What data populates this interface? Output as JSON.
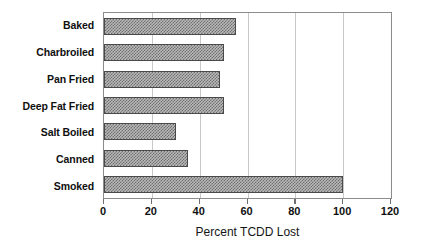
{
  "chart_data": {
    "type": "bar",
    "orientation": "horizontal",
    "title": "",
    "xlabel": "Percent TCDD Lost",
    "ylabel": "",
    "categories": [
      "Baked",
      "Charbroiled",
      "Pan Fried",
      "Deep Fat Fried",
      "Salt Boiled",
      "Canned",
      "Smoked"
    ],
    "values": [
      55,
      50,
      48.5,
      50,
      30,
      35,
      100
    ],
    "xlim": [
      0,
      120
    ],
    "xticks": [
      0,
      20,
      40,
      60,
      80,
      100,
      120
    ],
    "xtick_labels": [
      "0",
      "20",
      "40",
      "60",
      "80",
      "100",
      "120"
    ],
    "grid": "vertical",
    "legend": "none",
    "series": [
      {
        "name": "Percent TCDD Lost",
        "values": [
          55,
          50,
          48.5,
          50,
          30,
          35,
          100
        ]
      }
    ],
    "colors": {
      "bar_fill": "#b9b9b9",
      "bar_hatch": "#6f6f6f",
      "bar_border": "#4a4a4a",
      "gridline": "#c9c9c9",
      "frame": "#8c8c8c",
      "text": "#101010"
    }
  }
}
